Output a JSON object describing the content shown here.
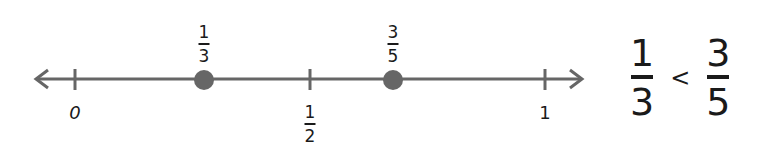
{
  "number_line": {
    "color": "#666666",
    "dot_color": "#666666",
    "ticks": [
      {
        "label": "0",
        "x": 75
      },
      {
        "label_num": "1",
        "label_den": "2",
        "x": 310
      },
      {
        "label": "1",
        "x": 545
      }
    ],
    "points": [
      {
        "num": "1",
        "den": "3",
        "x": 204
      },
      {
        "num": "3",
        "den": "5",
        "x": 393
      }
    ]
  },
  "comparison": {
    "left": {
      "num": "1",
      "den": "3"
    },
    "operator": "<",
    "right": {
      "num": "3",
      "den": "5"
    }
  }
}
